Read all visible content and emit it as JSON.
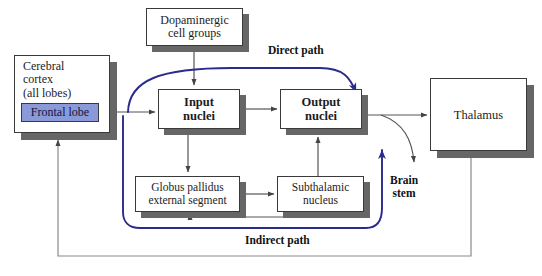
{
  "diagram": {
    "background_color": "#ffffff",
    "box_border_color": "#3a3a3a",
    "box_shadow_color": "#666666",
    "arrow_color": "#555555",
    "pathway_color": "#2b2b8c",
    "highlight_fill": "#8a99d8"
  },
  "nodes": {
    "cerebral_cortex": {
      "label": "Cerebral\ncortex\n(all lobes)",
      "x": 14,
      "y": 55,
      "w": 96,
      "h": 78
    },
    "frontal_lobe": {
      "label": "Frontal lobe",
      "x": 21,
      "y": 103,
      "w": 78,
      "h": 19
    },
    "dopaminergic": {
      "label": "Dopaminergic\ncell groups",
      "x": 146,
      "y": 8,
      "w": 97,
      "h": 38
    },
    "input_nuclei": {
      "label": "Input\nnuclei",
      "x": 158,
      "y": 89,
      "w": 82,
      "h": 40
    },
    "output_nuclei": {
      "label": "Output\nnuclei",
      "x": 280,
      "y": 89,
      "w": 82,
      "h": 40
    },
    "globus_pallidus": {
      "label": "Globus pallidus\nexternal segment",
      "x": 135,
      "y": 176,
      "w": 105,
      "h": 36
    },
    "subthalamic": {
      "label": "Subthalamic\nnucleus",
      "x": 277,
      "y": 176,
      "w": 87,
      "h": 36
    },
    "thalamus": {
      "label": "Thalamus",
      "x": 430,
      "y": 78,
      "w": 97,
      "h": 73
    }
  },
  "path_labels": {
    "direct": {
      "text": "Direct path",
      "x": 268,
      "y": 44
    },
    "indirect": {
      "text": "Indirect path",
      "x": 245,
      "y": 234
    },
    "brain_stem": {
      "text": "Brain\nstem",
      "x": 390,
      "y": 174
    }
  },
  "edges": [
    {
      "name": "cortex-to-input",
      "from": "cerebral_cortex",
      "to": "input_nuclei",
      "style": "gray-arrow"
    },
    {
      "name": "dopaminergic-to-input",
      "from": "dopaminergic",
      "to": "input_nuclei",
      "style": "gray-arrow"
    },
    {
      "name": "input-to-output",
      "from": "input_nuclei",
      "to": "output_nuclei",
      "style": "gray-arrow"
    },
    {
      "name": "output-to-thalamus",
      "from": "output_nuclei",
      "to": "thalamus",
      "style": "gray-arrow"
    },
    {
      "name": "output-to-brain-stem",
      "from": "output_nuclei",
      "to": "brain_stem",
      "style": "gray-curve-arrow"
    },
    {
      "name": "input-to-globus-pallidus",
      "from": "input_nuclei",
      "to": "globus_pallidus",
      "style": "gray-arrow"
    },
    {
      "name": "globus-pallidus-to-subthalamic",
      "from": "globus_pallidus",
      "to": "subthalamic",
      "style": "gray-arrow"
    },
    {
      "name": "subthalamic-to-globus-pallidus",
      "from": "subthalamic",
      "to": "globus_pallidus",
      "style": "gray-arrow"
    },
    {
      "name": "subthalamic-to-output",
      "from": "subthalamic",
      "to": "output_nuclei",
      "style": "gray-arrow"
    },
    {
      "name": "thalamus-to-cortex-feedback",
      "from": "thalamus",
      "to": "cerebral_cortex",
      "style": "gray-arrow"
    },
    {
      "name": "direct-pathway",
      "from": "cortex",
      "to": "output_nuclei",
      "style": "blue-curve-arrow"
    },
    {
      "name": "indirect-pathway",
      "from": "cortex",
      "to": "output_nuclei",
      "style": "blue-curve-arrow"
    }
  ]
}
